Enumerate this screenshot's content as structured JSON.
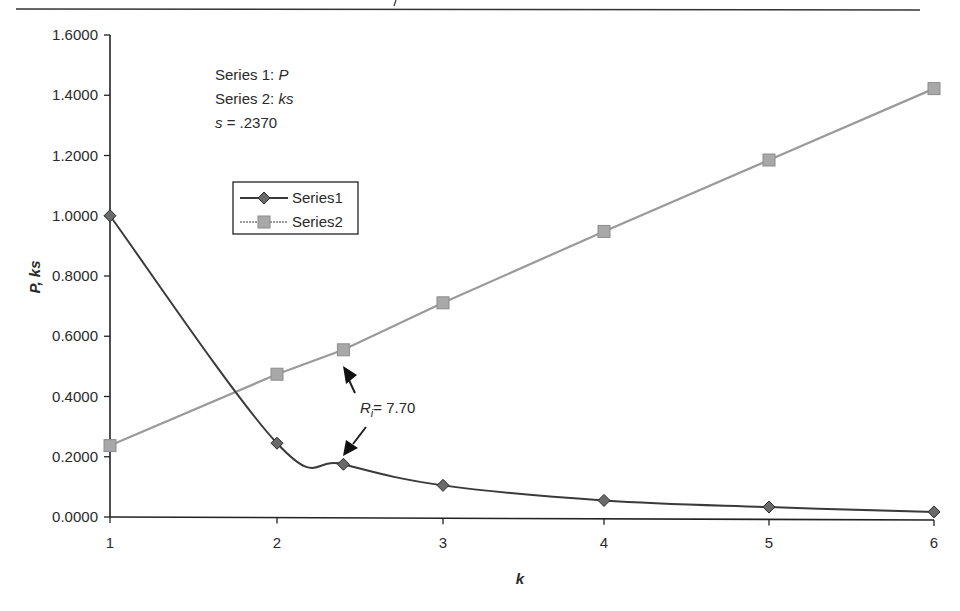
{
  "figure": {
    "notes": [
      {
        "prefix": "Series 1: ",
        "var": "P"
      },
      {
        "prefix": "Series 2: ",
        "var": "ks"
      },
      {
        "var": "s",
        "suffix": " = .2370"
      }
    ],
    "annotation": {
      "label_main": "R",
      "label_sub": "i",
      "label_value": "= 7.70"
    },
    "colors": {
      "series1": "#3a3a3a",
      "series2": "#9a9a9a",
      "axis": "#222222"
    }
  },
  "chart_data": {
    "type": "line",
    "title": "",
    "xlabel": "k",
    "ylabel": "P, ks",
    "x_ticks": [
      "1",
      "2",
      "3",
      "4",
      "5",
      "6"
    ],
    "y_ticks": [
      "0.0000",
      "0.2000",
      "0.4000",
      "0.6000",
      "0.8000",
      "1.0000",
      "1.2000",
      "1.4000",
      "1.6000"
    ],
    "ylim": [
      0,
      1.6
    ],
    "xlim": [
      1,
      6
    ],
    "grid": false,
    "legend": {
      "position": "upper-left-inside",
      "entries": [
        "Series1",
        "Series2"
      ]
    },
    "series": [
      {
        "name": "Series1",
        "description": "P",
        "marker": "diamond",
        "x": [
          1,
          2,
          2.4,
          3,
          4,
          5,
          6
        ],
        "y": [
          1.0,
          0.245,
          0.175,
          0.105,
          0.055,
          0.033,
          0.017
        ]
      },
      {
        "name": "Series2",
        "description": "ks",
        "marker": "square",
        "x": [
          1,
          2,
          2.4,
          3,
          4,
          5,
          6
        ],
        "y": [
          0.237,
          0.474,
          0.555,
          0.711,
          0.948,
          1.185,
          1.422
        ]
      }
    ],
    "annotations": [
      {
        "text": "Ri = 7.70",
        "points_to": [
          "Series1 at k≈2.4",
          "Series2 at k≈2.4"
        ]
      },
      {
        "text": "Series 1: P"
      },
      {
        "text": "Series 2: ks"
      },
      {
        "text": "s = .2370"
      }
    ]
  }
}
